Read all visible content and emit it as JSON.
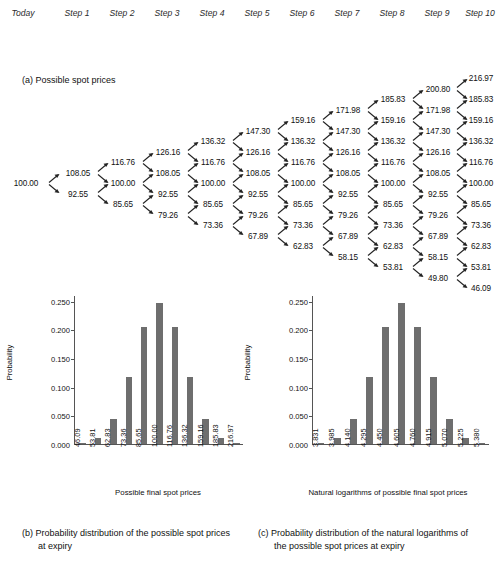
{
  "header": {
    "steps": [
      "Today",
      "Step 1",
      "Step 2",
      "Step 3",
      "Step 4",
      "Step 5",
      "Step 6",
      "Step 7",
      "Step 8",
      "Step 9",
      "Step 10"
    ]
  },
  "panel_a": {
    "caption": "(a) Possible spot prices",
    "tree": {
      "up_factor": "1.0805",
      "down_factor": "0.9255",
      "columns": [
        [
          "100.00"
        ],
        [
          "108.05",
          "92.55"
        ],
        [
          "116.76",
          "100.00",
          "85.65"
        ],
        [
          "126.16",
          "108.05",
          "92.55",
          "79.26"
        ],
        [
          "136.32",
          "116.76",
          "100.00",
          "85.65",
          "73.36"
        ],
        [
          "147.30",
          "126.16",
          "108.05",
          "92.55",
          "79.26",
          "67.89"
        ],
        [
          "159.16",
          "136.32",
          "116.76",
          "100.00",
          "85.65",
          "73.36",
          "62.83"
        ],
        [
          "171.98",
          "147.30",
          "126.16",
          "108.05",
          "92.55",
          "79.26",
          "67.89",
          "58.15"
        ],
        [
          "185.83",
          "159.16",
          "136.32",
          "116.76",
          "100.00",
          "85.65",
          "73.36",
          "62.83",
          "53.81"
        ],
        [
          "200.80",
          "171.98",
          "147.30",
          "126.16",
          "108.05",
          "92.55",
          "79.26",
          "67.89",
          "58.15",
          "49.80"
        ],
        [
          "216.97",
          "185.83",
          "159.16",
          "136.32",
          "116.76",
          "100.00",
          "85.65",
          "73.36",
          "62.83",
          "53.81",
          "46.09"
        ]
      ]
    }
  },
  "chart_data": [
    {
      "id": "chart-b",
      "type": "bar",
      "title": "",
      "xlabel": "Possible final spot prices",
      "ylabel": "Probability",
      "categories": [
        "46.09",
        "53.81",
        "62.83",
        "73.36",
        "85.65",
        "100.00",
        "116.76",
        "136.32",
        "159.16",
        "185.83",
        "216.97"
      ],
      "values": [
        0.001,
        0.01,
        0.044,
        0.117,
        0.205,
        0.246,
        0.205,
        0.117,
        0.044,
        0.01,
        0.001
      ],
      "ylim": [
        0,
        0.26
      ],
      "yticks": [
        "0.000",
        "0.050",
        "0.100",
        "0.150",
        "0.200",
        "0.250"
      ],
      "ytick_values": [
        0.0,
        0.05,
        0.1,
        0.15,
        0.2,
        0.25
      ],
      "grid": false,
      "legend": "none",
      "bar_color": "#6e6e6e",
      "caption_label": "(b)",
      "caption_text": "Probability distribution of the possible spot prices at expiry"
    },
    {
      "id": "chart-c",
      "type": "bar",
      "title": "",
      "xlabel": "Natural logarithms of possible final spot prices",
      "ylabel": "Probability",
      "categories": [
        "3.831",
        "3.985",
        "4.140",
        "4.295",
        "4.450",
        "4.605",
        "4.760",
        "4.915",
        "5.070",
        "5.225",
        "5.380"
      ],
      "values": [
        0.001,
        0.01,
        0.044,
        0.117,
        0.205,
        0.246,
        0.205,
        0.117,
        0.044,
        0.01,
        0.001
      ],
      "ylim": [
        0,
        0.26
      ],
      "yticks": [
        "0.000",
        "0.050",
        "0.100",
        "0.150",
        "0.200",
        "0.250"
      ],
      "ytick_values": [
        0.0,
        0.05,
        0.1,
        0.15,
        0.2,
        0.25
      ],
      "grid": false,
      "legend": "none",
      "bar_color": "#6e6e6e",
      "caption_label": "(c)",
      "caption_text": "Probability distribution of the natural logarithms of the possible spot prices at expiry"
    }
  ],
  "captions": {
    "b": "(b) Probability distribution of the possible spot prices at expiry",
    "c": "(c) Probability distribution of the natural logarithms of the possible spot prices at expiry"
  }
}
